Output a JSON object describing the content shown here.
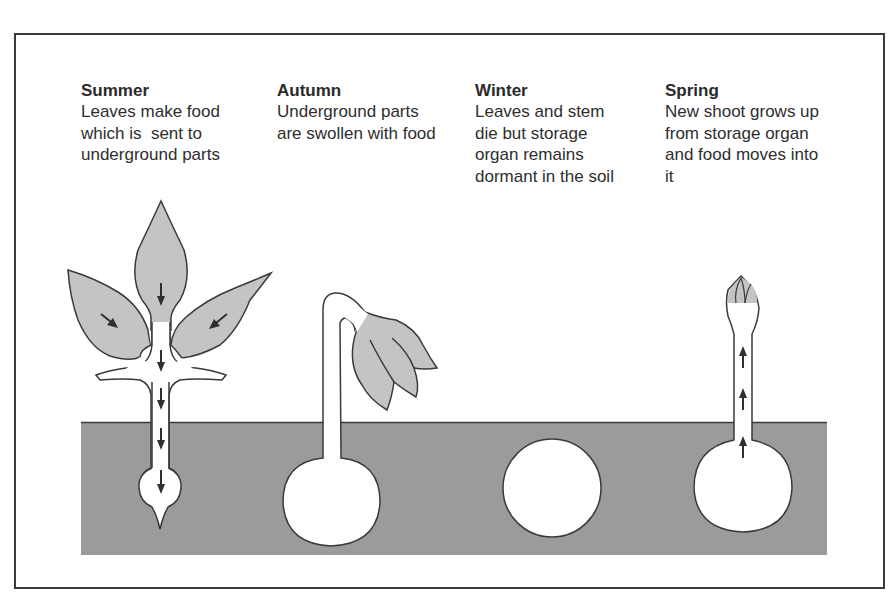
{
  "diagram": {
    "colors": {
      "soil": "#9b9b9b",
      "leaf": "#c4c4c4",
      "outline": "#3a3a3a",
      "background": "#ffffff",
      "arrow": "#2f2f2f"
    },
    "stages": [
      {
        "season": "Summer",
        "lines": [
          "Leaves make food",
          "which is  sent to",
          "underground parts"
        ],
        "arrow_direction": "down"
      },
      {
        "season": "Autumn",
        "lines": [
          "Underground parts",
          "are swollen with food"
        ],
        "arrow_direction": "none"
      },
      {
        "season": "Winter",
        "lines": [
          "Leaves and stem",
          "die but storage",
          "organ remains",
          "dormant in the soil"
        ],
        "arrow_direction": "none"
      },
      {
        "season": "Spring",
        "lines": [
          "New shoot grows up",
          "from storage organ",
          "and food moves into",
          "it"
        ],
        "arrow_direction": "up"
      }
    ],
    "icons": {
      "food_flow_down": "arrow-down-icon",
      "food_flow_up": "arrow-up-icon"
    }
  }
}
